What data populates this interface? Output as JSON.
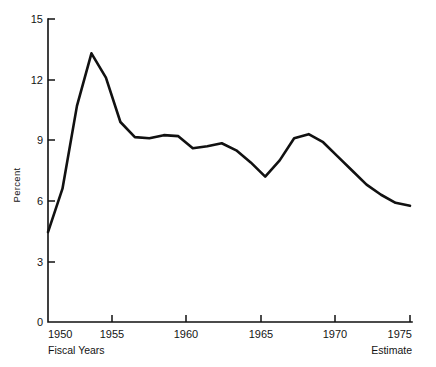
{
  "chart_data": {
    "type": "line",
    "title": "",
    "subtitle": "",
    "xlabel": "Fiscal Years",
    "ylabel": "Percent",
    "x_end_note": "Estimate",
    "xlim": [
      1950,
      1975
    ],
    "ylim": [
      0,
      15
    ],
    "grid": false,
    "legend": null,
    "x_ticks": [
      1950,
      1955,
      1960,
      1965,
      1970,
      1975
    ],
    "x_tick_labels": [
      "1950",
      "1955",
      "1960",
      "1965",
      "1970",
      "1975"
    ],
    "y_ticks": [
      0,
      3,
      6,
      9,
      12,
      15
    ],
    "y_tick_labels": [
      "0",
      "3",
      "6",
      "9",
      "12",
      "15"
    ],
    "series": [
      {
        "name": "Percent",
        "color": "#111111",
        "x": [
          1950,
          1951,
          1952,
          1953,
          1954,
          1955,
          1956,
          1957,
          1958,
          1959,
          1960,
          1961,
          1962,
          1963,
          1964,
          1965,
          1966,
          1967,
          1968,
          1969,
          1970,
          1971,
          1972,
          1973,
          1974,
          1975
        ],
        "values": [
          4.45,
          6.6,
          10.7,
          13.3,
          12.1,
          9.9,
          9.15,
          9.1,
          9.25,
          9.2,
          8.6,
          8.7,
          8.85,
          8.5,
          7.9,
          7.2,
          8.0,
          9.1,
          9.3,
          8.9,
          8.2,
          7.5,
          6.8,
          6.3,
          5.9,
          5.75
        ]
      }
    ]
  },
  "axis": {
    "y_title": "Percent",
    "x_caption_left": "Fiscal Years",
    "x_caption_right": "Estimate"
  },
  "colors": {
    "line": "#111111",
    "axis": "#111111",
    "background": "#ffffff",
    "text": "#141414"
  }
}
